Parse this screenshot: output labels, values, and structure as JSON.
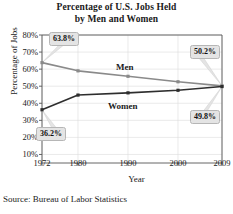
{
  "chart_data": {
    "type": "line",
    "title": "Percentage of U.S. Jobs Held by Men and Women",
    "title_line1": "Percentage of U.S. Jobs Held",
    "title_line2": "by Men and Women",
    "xlabel": "Year",
    "ylabel": "Percentage of Jobs",
    "source": "Source: Bureau of Labor Statistics",
    "x": [
      1972,
      1980,
      1990,
      2000,
      2009
    ],
    "xtick_labels": [
      "1972",
      "1980",
      "1990",
      "2000",
      "2009"
    ],
    "ytick_labels": [
      "80%",
      "70%",
      "60%",
      "50%",
      "40%",
      "30%",
      "20%",
      "10%"
    ],
    "ytick_values": [
      80,
      70,
      60,
      50,
      40,
      30,
      20,
      10
    ],
    "ylim": [
      5,
      80
    ],
    "xlim": [
      1972,
      2009
    ],
    "grid": true,
    "legend": "inline-labels",
    "series": [
      {
        "name": "Men",
        "color": "#8a8a8a",
        "values": [
          63.8,
          59.0,
          55.8,
          52.6,
          50.2
        ]
      },
      {
        "name": "Women",
        "color": "#2e2e2e",
        "values": [
          36.2,
          44.8,
          46.1,
          47.6,
          49.8
        ]
      }
    ],
    "annotations": [
      {
        "text": "63.8%",
        "series": "Men",
        "year": 1972
      },
      {
        "text": "50.2%",
        "series": "Men",
        "year": 2009
      },
      {
        "text": "36.2%",
        "series": "Women",
        "year": 1972
      },
      {
        "text": "49.8%",
        "series": "Women",
        "year": 2009
      }
    ]
  }
}
